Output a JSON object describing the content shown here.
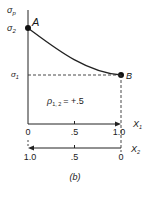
{
  "diagram": {
    "y_axis_label": "σ",
    "y_axis_label_sub": "p",
    "y_tick_upper": "σ",
    "y_tick_upper_sub": "2",
    "y_tick_lower": "σ",
    "y_tick_lower_sub": "1",
    "point_a_label": "A",
    "point_b_label": "B",
    "correlation_label": "ρ",
    "correlation_sub": "1, 2",
    "correlation_value": "=  +.5",
    "x1_axis_label": "X",
    "x1_axis_sub": "1",
    "x1_ticks": [
      "0",
      ".5",
      "1.0"
    ],
    "x2_axis_label": "X",
    "x2_axis_sub": "2",
    "x2_ticks": [
      "1.0",
      ".5",
      "0"
    ],
    "caption": "(b)"
  }
}
